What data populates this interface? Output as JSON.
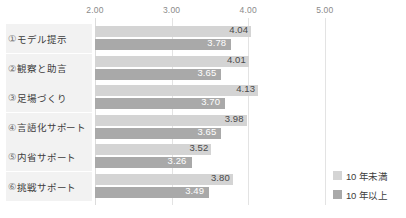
{
  "chart_data": {
    "type": "bar",
    "orientation": "horizontal",
    "title": "",
    "xlabel": "",
    "ylabel": "",
    "xlim": [
      2.0,
      5.2
    ],
    "grid": true,
    "gridlines": [
      2.0,
      3.0,
      4.0,
      5.0
    ],
    "tick_labels": [
      "2.00",
      "3.00",
      "4.00",
      "5.00"
    ],
    "legend_position": "bottom-right",
    "categories": [
      "①モデル提示",
      "②観察と助言",
      "③足場づくり",
      "④言語化サポート",
      "⑤内省サポート",
      "⑥挑戦サポート"
    ],
    "series": [
      {
        "name": "10 年未満",
        "color": "#d4d4d4",
        "values": [
          4.04,
          4.01,
          4.13,
          3.98,
          3.52,
          3.8
        ],
        "labels": [
          "4.04",
          "4.01",
          "4.13",
          "3.98",
          "3.52",
          "3.80"
        ]
      },
      {
        "name": "10 年以上",
        "color": "#a9a9a9",
        "values": [
          3.78,
          3.65,
          3.7,
          3.65,
          3.26,
          3.49
        ],
        "labels": [
          "3.78",
          "3.65",
          "3.70",
          "3.65",
          "3.26",
          "3.49"
        ]
      }
    ]
  },
  "legend": {
    "items": [
      {
        "label": "10 年未満"
      },
      {
        "label": "10 年以上"
      }
    ]
  }
}
